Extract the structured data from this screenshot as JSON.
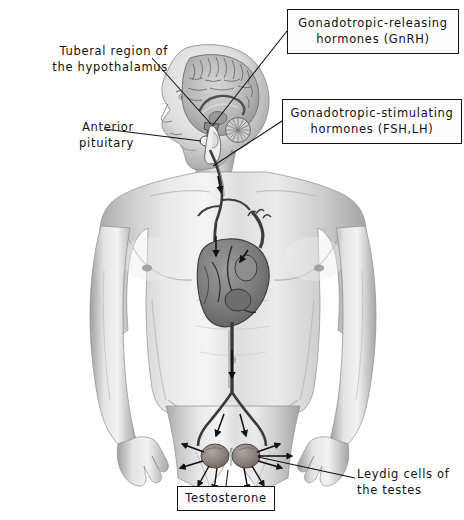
{
  "figure": {
    "background_color": "#ffffff",
    "line_color": "#111111",
    "text_color": "#111111"
  },
  "labels": {
    "hypothalamus": {
      "text": "Tuberal region of\nthe hypothalamus",
      "style": "plain",
      "x": 18,
      "y": 44,
      "width": 150,
      "height": 34
    },
    "anterior_pituitary": {
      "text": "Anterior\npituitary",
      "style": "plain",
      "x": 44,
      "y": 120,
      "width": 90,
      "height": 34
    },
    "gnrh": {
      "text": "Gonadotropic-releasing\nhormones (GnRH)",
      "style": "boxed",
      "x": 287,
      "y": 9,
      "width": 172,
      "height": 45
    },
    "fsh_lh": {
      "text": "Gonadotropic-stimulating\nhormones (FSH,LH)",
      "style": "boxed",
      "x": 282,
      "y": 99,
      "width": 180,
      "height": 45
    },
    "leydig": {
      "text": "Leydig cells of\nthe testes",
      "style": "plain",
      "x": 357,
      "y": 467,
      "width": 104,
      "height": 34
    },
    "testosterone": {
      "text": "Testosterone",
      "style": "boxed",
      "x": 177,
      "y": 486,
      "width": 98,
      "height": 25
    }
  },
  "anatomy": {
    "parts": [
      {
        "name": "head-sagittal-brain",
        "description": "Lateral view of head with mid-sagittal brain section showing cerebrum, corpus callosum, cerebellum and brainstem"
      },
      {
        "name": "hypothalamus-region",
        "description": "Tuberal region of the hypothalamus at the base of the brain"
      },
      {
        "name": "anterior-pituitary",
        "description": "Anterior pituitary gland beneath the hypothalamus"
      },
      {
        "name": "torso",
        "description": "Male torso, shoulders, chest, abdomen and arms"
      },
      {
        "name": "heart",
        "description": "Heart with aortic arch and great vessels"
      },
      {
        "name": "carotid-vessel",
        "description": "Vessel descending from the head through the neck to the heart"
      },
      {
        "name": "aorta",
        "description": "Descending aorta running through the abdomen"
      },
      {
        "name": "iliac-arteries",
        "description": "Aortic bifurcation into the common iliac arteries"
      },
      {
        "name": "testes",
        "description": "Paired testes at the base of the pelvis with radiating arrows"
      }
    ],
    "flow_arrows": [
      {
        "name": "gnrh-to-pituitary",
        "from": "hypothalamus",
        "to": "anterior pituitary"
      },
      {
        "name": "pituitary-to-circulation",
        "from": "anterior pituitary",
        "to": "neck vessel"
      },
      {
        "name": "neck-to-heart",
        "from": "neck vessel",
        "to": "heart"
      },
      {
        "name": "heart-to-aorta",
        "from": "heart",
        "to": "descending aorta"
      },
      {
        "name": "aorta-to-iliac",
        "from": "descending aorta",
        "to": "iliac arteries"
      },
      {
        "name": "iliac-to-testes",
        "from": "iliac arteries",
        "to": "testes"
      },
      {
        "name": "testosterone-release",
        "from": "testes",
        "to": "systemic circulation"
      }
    ]
  }
}
